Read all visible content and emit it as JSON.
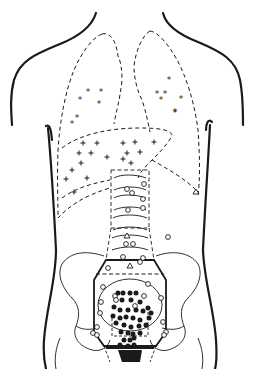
{
  "figure": {
    "type": "anatomical-distribution-diagram",
    "view": "anterior torso outline",
    "colors": {
      "ink": "#1a1a1a",
      "background": "#ffffff"
    },
    "markers": {
      "asterisk": {
        "region": "lungs",
        "glyph": "*"
      },
      "plus": {
        "region": "liver-upper-abdomen",
        "glyph": "+"
      },
      "open-circle": {
        "region": "lumbar-spine-and-pelvis",
        "glyph": "○"
      },
      "filled-circle": {
        "region": "pelvic-cavity",
        "glyph": "●"
      },
      "triangle": {
        "region": "lumbar-spine / flank",
        "glyph": "△"
      }
    },
    "lung_asterisks": [
      [
        88,
        92
      ],
      [
        101,
        92
      ],
      [
        80,
        100
      ],
      [
        99,
        104
      ],
      [
        77,
        118
      ],
      [
        72,
        124
      ],
      [
        169,
        80
      ],
      [
        157,
        94
      ],
      [
        165,
        94
      ],
      [
        161,
        100
      ],
      [
        181,
        99
      ],
      [
        175,
        112
      ],
      [
        175,
        113
      ]
    ],
    "liver_pluses": [
      [
        83,
        143
      ],
      [
        97,
        143
      ],
      [
        123,
        143
      ],
      [
        135,
        142
      ],
      [
        154,
        142
      ],
      [
        79,
        153
      ],
      [
        91,
        153
      ],
      [
        127,
        153
      ],
      [
        140,
        152
      ],
      [
        123,
        159
      ],
      [
        107,
        157
      ],
      [
        131,
        163
      ],
      [
        81,
        163
      ],
      [
        72,
        170
      ],
      [
        66,
        179
      ],
      [
        87,
        178
      ],
      [
        74,
        192
      ]
    ],
    "open_circles": [
      [
        144,
        184
      ],
      [
        143,
        199
      ],
      [
        127,
        189
      ],
      [
        132,
        193
      ],
      [
        143,
        208
      ],
      [
        128,
        210
      ],
      [
        168,
        237
      ],
      [
        126,
        244
      ],
      [
        133,
        244
      ],
      [
        123,
        257
      ],
      [
        143,
        258
      ],
      [
        140,
        262
      ],
      [
        108,
        268
      ],
      [
        103,
        287
      ],
      [
        148,
        284
      ],
      [
        115,
        296
      ],
      [
        144,
        296
      ],
      [
        161,
        298
      ],
      [
        101,
        302
      ],
      [
        100,
        313
      ],
      [
        116,
        300
      ],
      [
        163,
        322
      ],
      [
        97,
        327
      ],
      [
        93,
        333
      ],
      [
        97,
        335
      ],
      [
        166,
        332
      ],
      [
        164,
        335
      ],
      [
        135,
        306
      ]
    ],
    "filled_circles": [
      [
        118,
        293
      ],
      [
        123,
        293
      ],
      [
        130,
        293
      ],
      [
        136,
        293
      ],
      [
        122,
        300
      ],
      [
        131,
        300
      ],
      [
        140,
        302
      ],
      [
        114,
        307
      ],
      [
        120,
        310
      ],
      [
        128,
        310
      ],
      [
        136,
        310
      ],
      [
        143,
        311
      ],
      [
        148,
        308
      ],
      [
        151,
        313
      ],
      [
        113,
        316
      ],
      [
        120,
        318
      ],
      [
        126,
        317
      ],
      [
        133,
        318
      ],
      [
        140,
        320
      ],
      [
        149,
        318
      ],
      [
        116,
        323
      ],
      [
        124,
        325
      ],
      [
        131,
        327
      ],
      [
        139,
        326
      ],
      [
        146,
        325
      ],
      [
        121,
        332
      ],
      [
        128,
        333
      ],
      [
        133,
        334
      ],
      [
        140,
        333
      ],
      [
        124,
        340
      ],
      [
        130,
        340
      ],
      [
        134,
        338
      ],
      [
        120,
        345
      ],
      [
        128,
        346
      ],
      [
        134,
        345
      ]
    ],
    "triangles": [
      [
        196,
        192
      ],
      [
        127,
        236
      ],
      [
        130,
        266
      ]
    ]
  }
}
